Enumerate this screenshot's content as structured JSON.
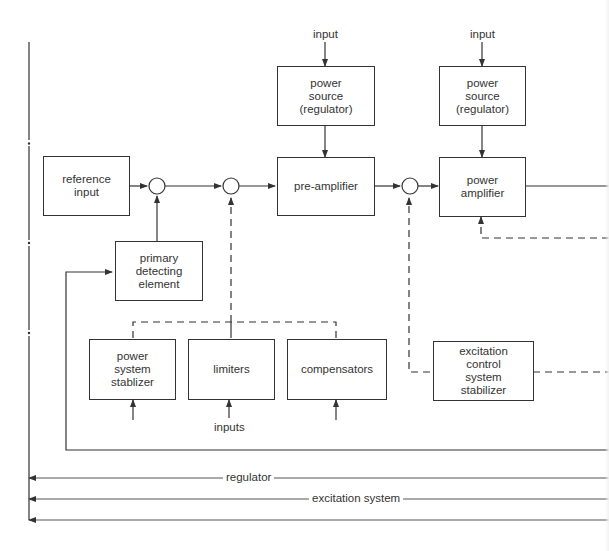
{
  "diagram": {
    "blocks": {
      "reference_input": "reference\ninput",
      "power_source_1": "power\nsource\n(regulator)",
      "power_source_2": "power\nsource\n(regulator)",
      "pre_amplifier": "pre-amplifier",
      "power_amplifier": "power\namplifier",
      "primary_detecting_element": "primary\ndetecting\nelement",
      "power_system_stabilizer": "power\nsystem\nstablizer",
      "limiters": "limiters",
      "compensators": "compensators",
      "excitation_control_system_stabilizer": "excitation\ncontrol\nsystem\nstabilizer"
    },
    "labels": {
      "input_1": "input",
      "input_2": "input",
      "inputs": "inputs",
      "regulator": "regulator",
      "excitation_system": "excitation system"
    },
    "colors": {
      "line": "#333333",
      "background": "#ffffff"
    }
  }
}
